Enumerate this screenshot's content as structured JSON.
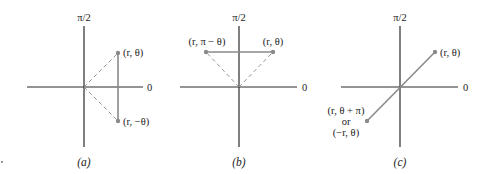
{
  "figure": {
    "panels": [
      {
        "id": "a",
        "caption": "(a)",
        "axis_labels": {
          "vertical": "π/2",
          "horizontal": "0"
        },
        "points": [
          {
            "label": "(r, θ)"
          },
          {
            "label": "(r, −θ)"
          }
        ],
        "description": "Symmetry about the polar axis: (r, θ) and (r, −θ) joined by a vertical segment, with dashed rays to origin"
      },
      {
        "id": "b",
        "caption": "(b)",
        "axis_labels": {
          "vertical": "π/2",
          "horizontal": "0"
        },
        "points": [
          {
            "label": "(r, π − θ)"
          },
          {
            "label": "(r, θ)"
          }
        ],
        "description": "Symmetry about the line θ = π/2: (r, θ) and (r, π − θ) joined by a horizontal segment, with dashed rays to origin"
      },
      {
        "id": "c",
        "caption": "(c)",
        "axis_labels": {
          "vertical": "π/2",
          "horizontal": "0"
        },
        "points": [
          {
            "label": "(r, θ)"
          },
          {
            "label_line1": "(r, θ + π)",
            "label_line2": "or",
            "label_line3": "(−r, θ)"
          }
        ],
        "description": "Symmetry about the pole: (r, θ) and (r, θ + π) = (−r, θ) joined by a segment through the origin"
      }
    ],
    "colors": {
      "axis": "#2a2a2a",
      "segment": "#8a8a8a",
      "text": "#222222",
      "background": "#ffffff"
    }
  }
}
